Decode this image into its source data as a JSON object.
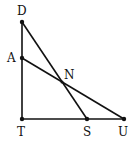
{
  "diagram": {
    "type": "geometry",
    "points": {
      "D": {
        "label": "D",
        "x": 22,
        "y": 22
      },
      "A": {
        "label": "A",
        "x": 22,
        "y": 58
      },
      "T": {
        "label": "T",
        "x": 22,
        "y": 119
      },
      "S": {
        "label": "S",
        "x": 87,
        "y": 119
      },
      "U": {
        "label": "U",
        "x": 124,
        "y": 119
      },
      "N": {
        "label": "N",
        "x": 62,
        "y": 82
      }
    },
    "segments": [
      [
        "D",
        "T"
      ],
      [
        "T",
        "U"
      ],
      [
        "D",
        "S"
      ],
      [
        "A",
        "U"
      ]
    ],
    "line_color": "#111111"
  }
}
